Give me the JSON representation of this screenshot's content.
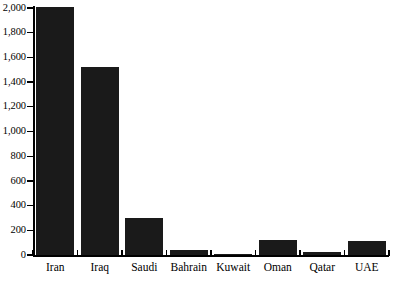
{
  "chart_data": {
    "type": "bar",
    "title": "",
    "subtitle": "",
    "xlabel": "",
    "ylabel": "",
    "categories": [
      "Iran",
      "Iraq",
      "Saudi",
      "Bahrain",
      "Kuwait",
      "Oman",
      "Qatar",
      "UAE"
    ],
    "values": [
      2010,
      1520,
      300,
      40,
      5,
      120,
      25,
      110
    ],
    "series": [
      {
        "name": "",
        "values": [
          2010,
          1520,
          300,
          40,
          5,
          120,
          25,
          110
        ]
      }
    ],
    "ylim": [
      0,
      2000
    ],
    "ytick_values": [
      0,
      200,
      400,
      600,
      800,
      1000,
      1200,
      1400,
      1600,
      1800,
      2000
    ],
    "ytick_labels": [
      "0",
      "200",
      "400",
      "600",
      "800",
      "1,000",
      "1,200",
      "1,400",
      "1,600",
      "1,800",
      "2,000"
    ],
    "grid": false,
    "legend": null,
    "legend_position": "none",
    "bar_color": "#1a1a1a",
    "axis_color": "#000000",
    "background_color": "#ffffff"
  }
}
